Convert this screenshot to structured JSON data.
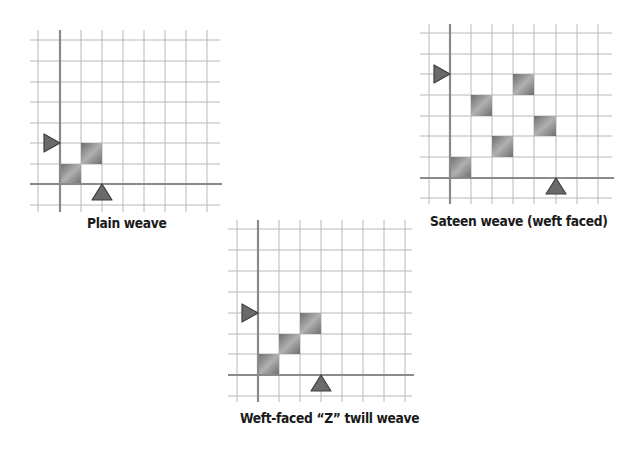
{
  "colors": {
    "grid_line": "#b8b8b8",
    "axis_line": "#8a8a8a",
    "cell_dark": "#6e6e6e",
    "cell_light": "#b0b0b0",
    "marker_fill": "#6a6a6a",
    "marker_stroke": "#3f3f3f",
    "caption": "#1a1a1a"
  },
  "diagrams": [
    {
      "id": "plain",
      "caption": "Plain weave",
      "grid": {
        "x_lines": [
          38,
          60,
          81,
          102,
          123,
          144,
          165,
          186,
          207
        ],
        "y_lines": [
          40,
          61,
          82,
          102,
          123,
          143,
          164,
          184,
          205
        ],
        "x_extent": [
          30,
          220
        ],
        "y_extent": [
          30,
          212
        ],
        "axis_x": 60,
        "axis_y": 184
      },
      "filled_cells": [
        {
          "col": 0,
          "row": 0
        },
        {
          "col": 1,
          "row": 1
        }
      ],
      "weft_marker": {
        "icon": "right-pointing-triangle",
        "row_top": 1
      },
      "warp_marker": {
        "icon": "up-pointing-triangle",
        "col_right": 1
      },
      "caption_pos": {
        "x": 87,
        "y": 215
      }
    },
    {
      "id": "sateen",
      "caption": "Sateen weave (weft faced)",
      "grid": {
        "x_lines": [
          429,
          450,
          471,
          492,
          513,
          534,
          556,
          577,
          598
        ],
        "y_lines": [
          33,
          54,
          74,
          95,
          116,
          136,
          157,
          178,
          198
        ],
        "x_extent": [
          420,
          612
        ],
        "y_extent": [
          24,
          204
        ],
        "axis_x": 450,
        "axis_y": 178
      },
      "filled_cells": [
        {
          "col": 0,
          "row": 0
        },
        {
          "col": 2,
          "row": 1
        },
        {
          "col": 4,
          "row": 2
        },
        {
          "col": 1,
          "row": 3
        },
        {
          "col": 3,
          "row": 4
        }
      ],
      "weft_marker": {
        "icon": "right-pointing-triangle",
        "row_top": 4
      },
      "warp_marker": {
        "icon": "up-pointing-triangle",
        "col_right": 4
      },
      "caption_pos": {
        "x": 430,
        "y": 213
      }
    },
    {
      "id": "twill",
      "caption": "Weft-faced “Z” twill weave",
      "grid": {
        "x_lines": [
          237,
          258,
          279,
          300,
          321,
          342,
          363,
          384,
          405
        ],
        "y_lines": [
          229,
          250,
          271,
          292,
          313,
          334,
          354,
          375,
          396
        ],
        "x_extent": [
          228,
          412
        ],
        "y_extent": [
          220,
          402
        ],
        "axis_x": 258,
        "axis_y": 375
      },
      "filled_cells": [
        {
          "col": 0,
          "row": 0
        },
        {
          "col": 1,
          "row": 1
        },
        {
          "col": 2,
          "row": 2
        }
      ],
      "weft_marker": {
        "icon": "right-pointing-triangle",
        "row_top": 2
      },
      "warp_marker": {
        "icon": "up-pointing-triangle",
        "col_right": 2
      },
      "caption_pos": {
        "x": 240,
        "y": 410
      }
    }
  ]
}
